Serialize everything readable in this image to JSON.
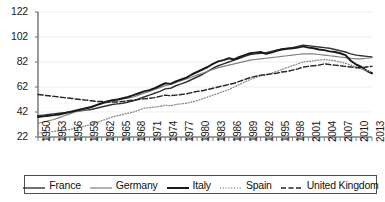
{
  "chart_data": {
    "type": "line",
    "title": "",
    "subtitle": "",
    "xlabel": "",
    "ylabel": "",
    "xlim": [
      1950,
      2013
    ],
    "ylim": [
      22,
      122
    ],
    "grid": true,
    "grid_axis": "y",
    "legend_position": "bottom",
    "ytick_labels": [
      "22",
      "42",
      "62",
      "82",
      "102",
      "122"
    ],
    "ytick_values": [
      22,
      42,
      62,
      82,
      102,
      122
    ],
    "xtick_labels": [
      "1950",
      "1953",
      "1956",
      "1959",
      "1962",
      "1965",
      "1968",
      "1971",
      "1974",
      "1977",
      "1980",
      "1983",
      "1986",
      "1989",
      "1992",
      "1995",
      "1998",
      "2001",
      "2004",
      "2007",
      "2010",
      "2013"
    ],
    "xtick_values": [
      1950,
      1953,
      1956,
      1959,
      1962,
      1965,
      1968,
      1971,
      1974,
      1977,
      1980,
      1983,
      1986,
      1989,
      1992,
      1995,
      1998,
      2001,
      2004,
      2007,
      2010,
      2013
    ],
    "x": [
      1950,
      1951,
      1952,
      1953,
      1954,
      1955,
      1956,
      1957,
      1958,
      1959,
      1960,
      1961,
      1962,
      1963,
      1964,
      1965,
      1966,
      1967,
      1968,
      1969,
      1970,
      1971,
      1972,
      1973,
      1974,
      1975,
      1976,
      1977,
      1978,
      1979,
      1980,
      1981,
      1982,
      1983,
      1984,
      1985,
      1986,
      1987,
      1988,
      1989,
      1990,
      1991,
      1992,
      1993,
      1994,
      1995,
      1996,
      1997,
      1998,
      1999,
      2000,
      2001,
      2002,
      2003,
      2004,
      2005,
      2006,
      2007,
      2008,
      2009,
      2010,
      2011,
      2012,
      2013
    ],
    "series": [
      {
        "name": "France",
        "style": "solid",
        "color": "#333333",
        "width": 1.4,
        "values": [
          39,
          39.5,
          40,
          40.5,
          41,
          41.5,
          42,
          42.5,
          43,
          43.5,
          44,
          45,
          46,
          47,
          48,
          48.5,
          49,
          50,
          51,
          52.5,
          54,
          55.5,
          57,
          58.5,
          60.5,
          61,
          63,
          64.5,
          66,
          68,
          70,
          72,
          74.5,
          77,
          79,
          80.5,
          82,
          83.5,
          85,
          86.5,
          88,
          88.5,
          89,
          89.5,
          90.5,
          91.5,
          92.5,
          93,
          93.5,
          94.5,
          95.5,
          95,
          94.5,
          94,
          93.5,
          93,
          92,
          91,
          90,
          88.5,
          87.5,
          87,
          86.5,
          86
        ]
      },
      {
        "name": "Germany",
        "style": "solid",
        "color": "#808080",
        "width": 1.2,
        "values": [
          33,
          34,
          35,
          36,
          37.5,
          39,
          40.5,
          42,
          43,
          44,
          45.5,
          47,
          48.5,
          49.5,
          50.5,
          51.5,
          52.5,
          53,
          54,
          55.5,
          57,
          58.5,
          60,
          61.5,
          63,
          64,
          65.5,
          67,
          68.5,
          70,
          71.5,
          73,
          74.5,
          76,
          77.5,
          78.5,
          79.5,
          80.5,
          81.5,
          82.5,
          83.5,
          84,
          84.5,
          85,
          85.5,
          86,
          86.5,
          87,
          87.5,
          88,
          88.5,
          88.5,
          88.5,
          88,
          87.5,
          87,
          86.5,
          86,
          85.5,
          85,
          84.5,
          84.5,
          85,
          85.5
        ]
      },
      {
        "name": "Italy",
        "style": "solid",
        "color": "#1a1a1a",
        "width": 2.0,
        "values": [
          38,
          38.5,
          39,
          39.5,
          40,
          41,
          42,
          43,
          44,
          45,
          46,
          47.5,
          49,
          50.5,
          51.5,
          52,
          53,
          54,
          55.5,
          57,
          58.5,
          59.5,
          61,
          63,
          65,
          64.5,
          66.5,
          68,
          69.5,
          72,
          74,
          76,
          78,
          80.5,
          82.5,
          83.5,
          85,
          84,
          86,
          87.5,
          89,
          89.5,
          90,
          88.5,
          89.5,
          91,
          92,
          92.5,
          93,
          93.5,
          94.5,
          93.5,
          93,
          92,
          91.5,
          90.5,
          90,
          89,
          87.5,
          83,
          80,
          78,
          75,
          73
        ]
      },
      {
        "name": "Spain",
        "style": "dotted",
        "color": "#8c8c8c",
        "width": 1.3,
        "values": [
          25,
          25.5,
          26,
          26.5,
          27,
          27.5,
          28,
          29,
          30,
          31,
          32,
          33.5,
          35,
          36.5,
          38,
          39,
          40,
          41,
          42,
          43.5,
          45,
          45.5,
          46,
          46.5,
          47.5,
          47,
          48,
          48.5,
          49,
          50,
          51,
          52.5,
          54,
          55.5,
          57,
          58.5,
          60,
          62,
          64,
          66,
          68,
          69.5,
          71,
          71.5,
          73,
          74.5,
          76,
          77.5,
          79,
          80.5,
          82,
          82.5,
          83,
          83.5,
          84,
          83.5,
          83,
          82,
          81,
          79.5,
          78,
          76.5,
          75,
          74
        ]
      },
      {
        "name": "United Kingdom",
        "style": "dashed",
        "color": "#262626",
        "width": 1.5,
        "values": [
          56,
          55.5,
          55,
          54.5,
          54,
          53.5,
          53,
          52.5,
          52,
          51.5,
          51,
          50.5,
          50.5,
          50,
          50,
          50,
          50.5,
          51,
          51.5,
          52,
          52.5,
          53,
          53.5,
          54.5,
          55.5,
          55,
          55.5,
          56,
          56.5,
          57.5,
          58.5,
          59,
          60,
          61,
          62,
          63,
          64,
          65,
          66.5,
          68,
          69.5,
          70.5,
          71.5,
          72,
          72.5,
          73,
          74,
          74.5,
          75.5,
          76.5,
          78,
          78.5,
          79,
          79.5,
          80.5,
          80,
          79.5,
          79,
          78.5,
          78,
          77.5,
          77.5,
          78,
          78.5
        ]
      }
    ]
  },
  "legend": {
    "items": [
      {
        "label": "France",
        "style": "solid",
        "color": "#333333"
      },
      {
        "label": "Germany",
        "style": "solid",
        "color": "#808080"
      },
      {
        "label": "Italy",
        "style": "solid",
        "color": "#1a1a1a"
      },
      {
        "label": "Spain",
        "style": "dotted",
        "color": "#8c8c8c"
      },
      {
        "label": "United Kingdom",
        "style": "dashed",
        "color": "#262626"
      }
    ]
  },
  "axes": {
    "axis_color": "#808080",
    "grid_color": "#e6e6e6"
  }
}
